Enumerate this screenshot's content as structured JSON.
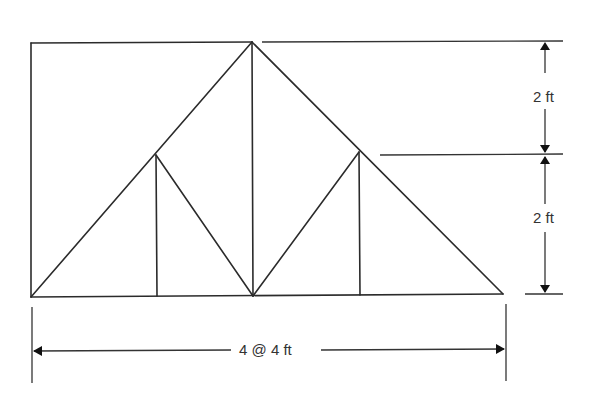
{
  "diagram": {
    "type": "truss",
    "dimensions": {
      "top_height": "2 ft",
      "bottom_height": "2 ft",
      "span": "4 @ 4 ft"
    },
    "colors": {
      "line": "#2b2b2b",
      "background": "#ffffff"
    }
  }
}
